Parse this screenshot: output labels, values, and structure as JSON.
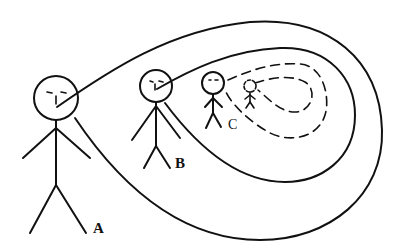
{
  "figure": {
    "ink_color": "#111111",
    "background": "#ffffff"
  },
  "figures": [
    {
      "id": "A",
      "label": "A"
    },
    {
      "id": "B",
      "label": "B"
    },
    {
      "id": "C",
      "label": "C"
    },
    {
      "id": "D",
      "label": ""
    }
  ]
}
